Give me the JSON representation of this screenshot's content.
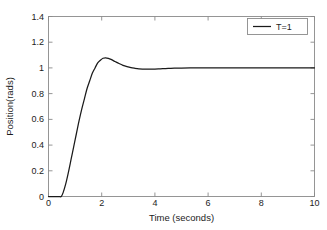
{
  "chart_data": {
    "type": "line",
    "title": "",
    "xlabel": "Time (seconds)",
    "ylabel": "Position(rads)",
    "xlim": [
      0,
      10
    ],
    "ylim": [
      0,
      1.4
    ],
    "xticks": [
      "0",
      "2",
      "4",
      "6",
      "8",
      "10"
    ],
    "xtick_values": [
      0,
      2,
      4,
      6,
      8,
      10
    ],
    "yticks": [
      "0",
      "0.2",
      "0.4",
      "0.6",
      "0.8",
      "1",
      "1.2",
      "1.4"
    ],
    "ytick_values": [
      0,
      0.2,
      0.4,
      0.6,
      0.8,
      1,
      1.2,
      1.4
    ],
    "grid": false,
    "legend_position": "top-right",
    "legend": [
      "T=1"
    ],
    "line_color": "#1a1a1a",
    "axis_color": "#8a8a8a",
    "background_color": "#ffffff",
    "series": [
      {
        "name": "T=1",
        "x": [
          0,
          0.1,
          0.2,
          0.3,
          0.4,
          0.48,
          0.55,
          0.65,
          0.75,
          0.85,
          0.95,
          1.05,
          1.15,
          1.25,
          1.35,
          1.45,
          1.55,
          1.65,
          1.75,
          1.85,
          1.95,
          2.05,
          2.15,
          2.25,
          2.35,
          2.5,
          2.65,
          2.8,
          2.95,
          3.1,
          3.25,
          3.4,
          3.55,
          3.7,
          3.85,
          4.0,
          4.2,
          4.4,
          4.6,
          4.8,
          5.0,
          5.5,
          6.0,
          6.5,
          7.0,
          7.5,
          8.0,
          8.5,
          9.0,
          9.5,
          10.0
        ],
        "y": [
          0,
          0,
          0,
          0,
          0,
          0,
          0.03,
          0.1,
          0.19,
          0.29,
          0.39,
          0.49,
          0.59,
          0.68,
          0.76,
          0.84,
          0.9,
          0.96,
          1.0,
          1.04,
          1.06,
          1.075,
          1.078,
          1.074,
          1.066,
          1.05,
          1.034,
          1.02,
          1.01,
          1.002,
          0.997,
          0.993,
          0.991,
          0.99,
          0.99,
          0.991,
          0.993,
          0.995,
          0.997,
          0.998,
          0.999,
          1.0,
          1.0,
          1.0,
          1.0,
          1.0,
          1.0,
          1.0,
          1.0,
          1.0,
          1.0
        ]
      }
    ],
    "annotations": {
      "peak_value": 1.078,
      "peak_time": 2.15,
      "steady_state": 1.0,
      "dead_time": 0.48
    }
  }
}
